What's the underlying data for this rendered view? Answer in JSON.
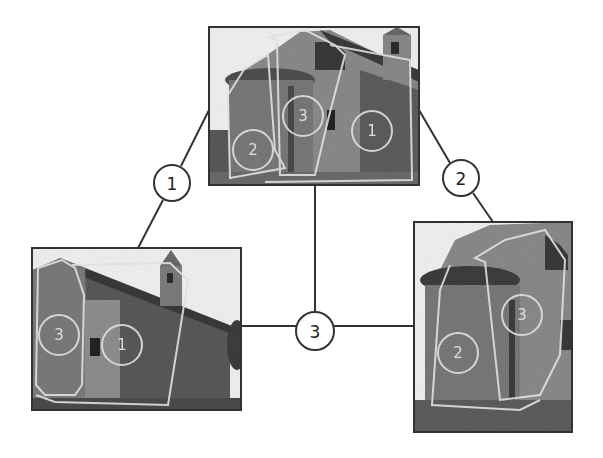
{
  "diagram": {
    "nodes": [
      {
        "id": "node-1",
        "label": "1",
        "connects": [
          "photo-left",
          "photo-top"
        ]
      },
      {
        "id": "node-2",
        "label": "2",
        "connects": [
          "photo-top",
          "photo-right"
        ]
      },
      {
        "id": "node-3",
        "label": "3",
        "connects": [
          "photo-left",
          "photo-right",
          "photo-top"
        ]
      }
    ],
    "photos": [
      {
        "id": "photo-top",
        "subject": "church apse and side wall",
        "region_labels": [
          "3",
          "2",
          "1"
        ]
      },
      {
        "id": "photo-left",
        "subject": "church side with bell tower",
        "region_labels": [
          "3",
          "1"
        ]
      },
      {
        "id": "photo-right",
        "subject": "church apse close view",
        "region_labels": [
          "2",
          "3"
        ]
      }
    ]
  }
}
